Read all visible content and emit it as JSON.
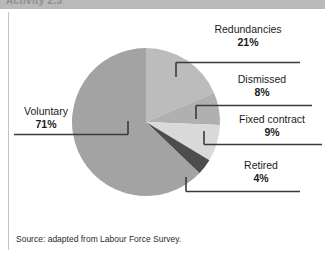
{
  "header": {
    "title": "Activity 2.3"
  },
  "source": {
    "note": "Source: adapted from Labour Force Survey."
  },
  "labels": {
    "voluntary": {
      "name": "Voluntary",
      "pct": "71%"
    },
    "redundancies": {
      "name": "Redundancies",
      "pct": "21%"
    },
    "dismissed": {
      "name": "Dismissed",
      "pct": "8%"
    },
    "fixed_contract": {
      "name": "Fixed contract",
      "pct": "9%"
    },
    "retired": {
      "name": "Retired",
      "pct": "4%"
    }
  },
  "colors": {
    "voluntary": "#a3a3a3",
    "redundancies": "#bcbcbc",
    "dismissed": "#b0b0b0",
    "fixed_contract": "#d9d9d9",
    "retired": "#4d4d4d",
    "leader_line": "#3a3a3a",
    "header_band": "#b9b9b9",
    "background": "#ffffff"
  },
  "chart_data": {
    "type": "pie",
    "title": "",
    "categories": [
      "Voluntary",
      "Redundancies",
      "Dismissed",
      "Fixed contract",
      "Retired"
    ],
    "values": [
      71,
      21,
      8,
      9,
      4
    ],
    "unit": "%",
    "labels_shown": true,
    "legend": "none",
    "slice_colors": [
      "#a3a3a3",
      "#bcbcbc",
      "#b0b0b0",
      "#d9d9d9",
      "#4d4d4d"
    ],
    "note": "Source: adapted from Labour Force Survey."
  }
}
